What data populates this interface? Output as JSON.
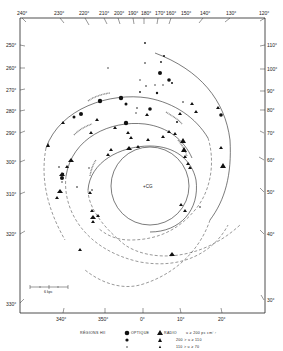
{
  "figure": {
    "top_axis_labels": [
      "240°",
      "230°",
      "220°",
      "210°",
      "200°",
      "190°",
      "180°",
      "170°",
      "160°",
      "150°",
      "140°",
      "130°",
      "120°"
    ],
    "left_axis_labels": [
      "250°",
      "260°",
      "270°",
      "280°",
      "290°",
      "300°",
      "310°",
      "320°",
      "330°"
    ],
    "right_axis_labels": [
      "110°",
      "100°",
      "90°",
      "80°",
      "70°",
      "60°",
      "50°",
      "40°",
      "30°"
    ],
    "bottom_axis_labels": [
      "340°",
      "350°",
      "0°",
      "10°",
      "20°"
    ],
    "center_label": "+CG",
    "scale_bar_label": "6 kpc"
  },
  "legend": {
    "title": "RÉGIONS HII",
    "optical_label": "OPTIQUE",
    "radio_label": "RADIO",
    "row1": "u ≥ 200 pc cm⁻²",
    "row2": "200 > u ≥ 110",
    "row3": "110 > u ≥ 70"
  }
}
